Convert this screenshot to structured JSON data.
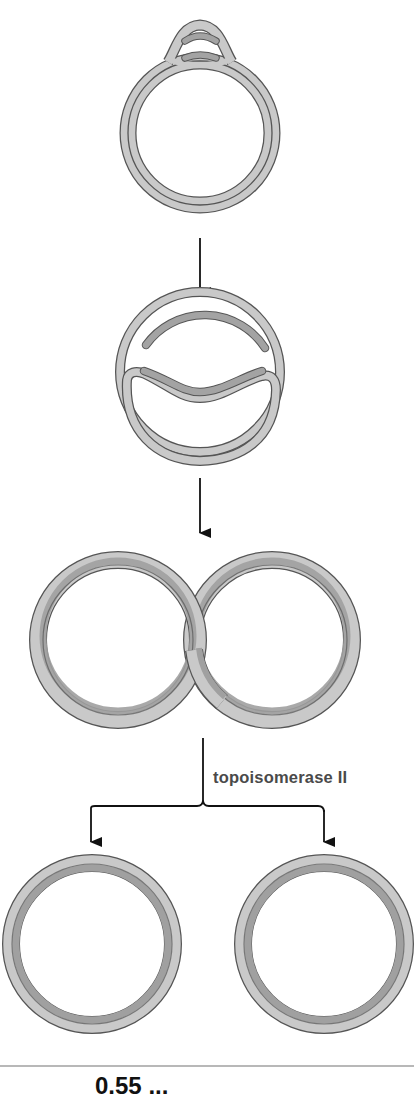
{
  "diagram": {
    "steps": [
      {
        "id": "replication-bubble",
        "description": "Circular DNA with replication bubble at origin"
      },
      {
        "id": "replication-progress",
        "description": "Replication forks progressing around the circle"
      },
      {
        "id": "catenane",
        "description": "Two interlinked daughter circles (catenane)"
      },
      {
        "id": "separated-circles",
        "description": "Two separated daughter circles"
      }
    ],
    "enzyme_label": "topoisomerase II",
    "caption_partial": "0.55 ...",
    "colors": {
      "strand_light": "#c8c8c8",
      "strand_dark": "#9e9e9e",
      "outline": "#555555",
      "arrow": "#111111",
      "label": "#4a4a4a"
    }
  }
}
